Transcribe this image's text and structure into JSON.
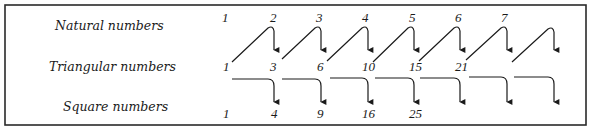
{
  "diagram": {
    "rows": [
      {
        "id": "natural",
        "label": "Natural numbers",
        "values": [
          "1",
          "2",
          "3",
          "4",
          "5",
          "6",
          "7"
        ]
      },
      {
        "id": "triangular",
        "label": "Triangular numbers",
        "values": [
          "1",
          "3",
          "6",
          "10",
          "15",
          "21"
        ]
      },
      {
        "id": "square",
        "label": "Square numbers",
        "values": [
          "1",
          "4",
          "9",
          "16",
          "25"
        ]
      }
    ],
    "relations": [
      {
        "description": "Each triangular number plus the next natural number gives the next triangular number (diagonal arrows from triangular row up to natural number, then down to next triangular)."
      },
      {
        "description": "Adding consecutive triangular numbers gives a square number (horizontal arrows from triangular row down to square row)."
      }
    ],
    "colors": {
      "ink": "#1a1a1a",
      "frame": "#2a2a2a",
      "background": "#ffffff"
    }
  }
}
